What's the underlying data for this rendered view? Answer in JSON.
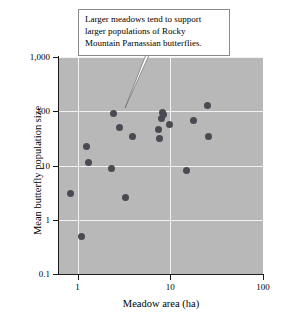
{
  "chart_data": {
    "type": "scatter",
    "title": "",
    "xlabel": "Meadow area (ha)",
    "ylabel": "Mean butterfly population size",
    "xscale": "log",
    "yscale": "log",
    "xlim": [
      0.63,
      100
    ],
    "ylim": [
      0.1,
      1000
    ],
    "grid": true,
    "legend": null,
    "xticks": [
      "1",
      "10",
      "100"
    ],
    "xtick_values": [
      1,
      10,
      100
    ],
    "yticks": [
      "0.1",
      "1",
      "10",
      "100",
      "1,000"
    ],
    "ytick_values": [
      0.1,
      1,
      10,
      100,
      1000
    ],
    "series": [
      {
        "name": "Rocky Mountain Parnassian meadows",
        "marker": "circle",
        "color": "#4a4a52",
        "points": [
          {
            "x": 0.83,
            "y": 3.0
          },
          {
            "x": 1.1,
            "y": 0.5
          },
          {
            "x": 1.25,
            "y": 22
          },
          {
            "x": 1.3,
            "y": 11.5
          },
          {
            "x": 2.3,
            "y": 8.8
          },
          {
            "x": 2.45,
            "y": 92
          },
          {
            "x": 2.85,
            "y": 51
          },
          {
            "x": 3.3,
            "y": 2.6
          },
          {
            "x": 3.9,
            "y": 34
          },
          {
            "x": 7.4,
            "y": 47
          },
          {
            "x": 7.6,
            "y": 31
          },
          {
            "x": 8.1,
            "y": 75
          },
          {
            "x": 8.3,
            "y": 95
          },
          {
            "x": 8.5,
            "y": 86
          },
          {
            "x": 9.8,
            "y": 58
          },
          {
            "x": 15.0,
            "y": 8.0
          },
          {
            "x": 18.0,
            "y": 68
          },
          {
            "x": 25.0,
            "y": 130
          },
          {
            "x": 26.0,
            "y": 34
          }
        ]
      }
    ],
    "annotations": [
      {
        "name": "trend-callout",
        "text": "Larger meadows tend to support larger populations of Rocky Mountain Parnassian butterflies.",
        "lines": [
          "Larger meadows tend to support",
          "larger populations of Rocky",
          "Mountain Parnassian butterflies."
        ],
        "points_to": {
          "x": 5.8,
          "y": 160
        }
      }
    ]
  },
  "colors": {
    "plot_background": "#b8b8b8",
    "gridline": "#f2f2f2",
    "marker": "#4a4a52",
    "axis": "#1a1a1a",
    "callout_background": "#ffffff",
    "callout_border": "#8a8a8a"
  }
}
